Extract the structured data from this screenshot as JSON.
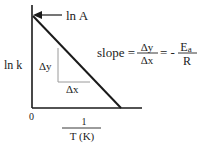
{
  "diagram": {
    "y_axis_label": "ln k",
    "x_axis_label_numerator": "1",
    "x_axis_label_denominator": "T (K)",
    "origin_label": "0",
    "intercept_label": "ln A",
    "delta_y_label": "Δy",
    "delta_x_label": "Δx",
    "slope": {
      "prefix": "slope =",
      "frac1_num": "Δy",
      "frac1_den": "Δx",
      "equals": "= -",
      "frac2_num": "E",
      "frac2_num_sub": "a",
      "frac2_den": "R"
    },
    "colors": {
      "axis": "#1a1a1a",
      "line": "#1a1a1a",
      "triangle": "#9a9a9a",
      "text": "#222222"
    }
  }
}
